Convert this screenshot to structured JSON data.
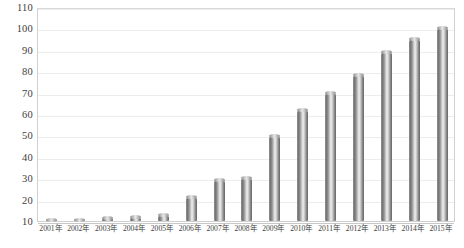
{
  "chart_data": {
    "type": "bar",
    "title": "",
    "xlabel": "",
    "ylabel": "",
    "ylim": [
      10,
      110
    ],
    "ytick_step": 10,
    "grid": true,
    "legend": false,
    "categories": [
      "2001年",
      "2002年",
      "2003年",
      "2004年",
      "2005年",
      "2006年",
      "2007年",
      "2008年",
      "2009年",
      "2010年",
      "2011年",
      "2012年",
      "2013年",
      "2014年",
      "2015年"
    ],
    "values": [
      10.6,
      10.7,
      11.6,
      12.0,
      12.6,
      21.0,
      29.0,
      30.0,
      49.5,
      62.0,
      70.0,
      78.0,
      89.0,
      95.0,
      100.0
    ],
    "ytick_labels": [
      "110",
      "100",
      "90",
      "80",
      "70",
      "60",
      "50",
      "40",
      "30",
      "20",
      "10"
    ],
    "ytick_values": [
      110,
      100,
      90,
      80,
      70,
      60,
      50,
      40,
      30,
      20,
      10
    ],
    "series": [
      {
        "name": "",
        "values": [
          10.6,
          10.7,
          11.6,
          12.0,
          12.6,
          21.0,
          29.0,
          30.0,
          49.5,
          62.0,
          70.0,
          78.0,
          89.0,
          95.0,
          100.0
        ]
      }
    ],
    "colors": {
      "bar_dark": "#707070",
      "bar_light": "#efefef",
      "gridline": "#ededed",
      "axis": "#c8c8c8",
      "text": "#3d3d3d",
      "background": "#ffffff"
    }
  }
}
